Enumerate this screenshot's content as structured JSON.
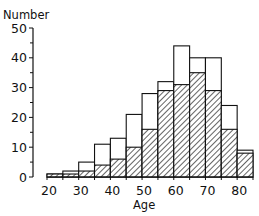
{
  "chart_data": {
    "type": "bar",
    "subtype": "histogram-overlay",
    "title": "",
    "xlabel": "Age",
    "ylabel": "Number",
    "bin_width": 5,
    "bins": [
      [
        20,
        25
      ],
      [
        25,
        30
      ],
      [
        30,
        35
      ],
      [
        35,
        40
      ],
      [
        40,
        45
      ],
      [
        45,
        50
      ],
      [
        50,
        55
      ],
      [
        55,
        60
      ],
      [
        60,
        65
      ],
      [
        65,
        70
      ],
      [
        70,
        75
      ],
      [
        75,
        80
      ],
      [
        80,
        85
      ]
    ],
    "categories": [
      "20-25",
      "25-30",
      "30-35",
      "35-40",
      "40-45",
      "45-50",
      "50-55",
      "55-60",
      "60-65",
      "65-70",
      "70-75",
      "75-80",
      "80-85"
    ],
    "series": [
      {
        "name": "Total (open bars)",
        "style": "open",
        "values": [
          1,
          2,
          5,
          11,
          13,
          21,
          28,
          32,
          44,
          40,
          40,
          24,
          9
        ]
      },
      {
        "name": "Subset (hatched bars)",
        "style": "hatched",
        "values": [
          1,
          1,
          2,
          4,
          6,
          10,
          16,
          29,
          31,
          35,
          29,
          16,
          8
        ]
      }
    ],
    "xticks": [
      20,
      30,
      40,
      50,
      60,
      70,
      80
    ],
    "xtick_labels": [
      "20",
      "30",
      "40",
      "50",
      "60",
      "70",
      "80"
    ],
    "yticks": [
      0,
      10,
      20,
      30,
      40,
      50
    ],
    "ytick_labels": [
      "0",
      "10",
      "20",
      "30",
      "40",
      "50"
    ],
    "xlim": [
      20,
      85
    ],
    "ylim": [
      0,
      50
    ],
    "grid": false,
    "legend": null
  },
  "colors": {
    "ink": "#111111",
    "background": "#ffffff"
  }
}
